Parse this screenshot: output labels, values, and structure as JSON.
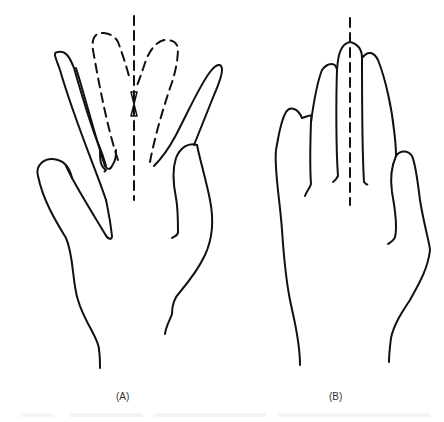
{
  "figure": {
    "panels": [
      {
        "id": "A",
        "label": "(A)",
        "description": "Hand with index and middle fingers spread, dashed outlines showing fingers converging toward midline axis"
      },
      {
        "id": "B",
        "label": "(B)",
        "description": "Hand with fingers together, dashed midline axis through middle finger"
      }
    ],
    "colors": {
      "stroke": "#111111",
      "background": "#ffffff",
      "label": "#333333"
    }
  }
}
